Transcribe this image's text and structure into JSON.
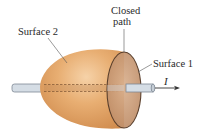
{
  "diagram": {
    "labels": {
      "closed_path_line1": "Closed",
      "closed_path_line2": "path",
      "surface2": "Surface 2",
      "surface1": "Surface 1",
      "current": "I"
    },
    "colors": {
      "surface_fill_light": "#f2c594",
      "surface_fill_mid": "#e2a466",
      "surface_fill_dark": "#c9854a",
      "cap_fill": "#c89a72",
      "outline": "#5a3f2c",
      "wire_fill": "#d5dde5",
      "wire_outline": "#7d8894",
      "dashed": "#7a5230",
      "leader": "#555555",
      "text": "#2a2a2a"
    }
  }
}
